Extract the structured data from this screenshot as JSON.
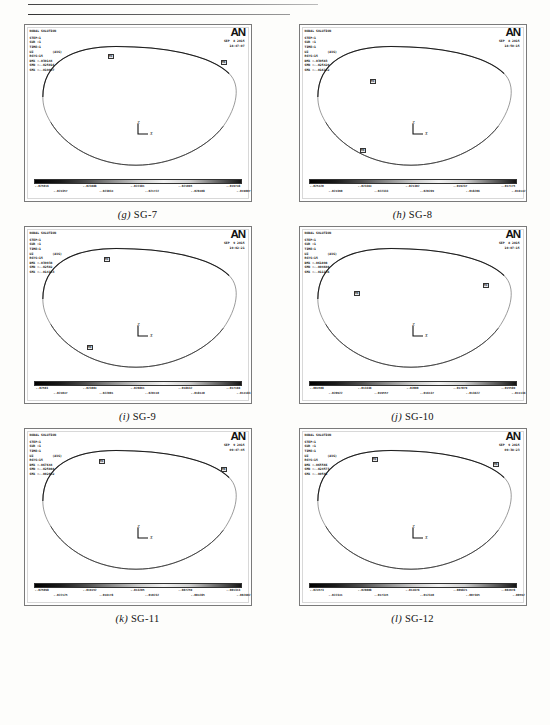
{
  "page": {
    "figure_count": 6,
    "software": "ANSYS",
    "logo_text": "AN"
  },
  "colorbar": {
    "stops": [
      "#000000",
      "#1a1a1a",
      "#4d4d4d",
      "#8c8c8c",
      "#c9c9c9",
      "#f2f2f2",
      "#d0d0d0",
      "#6e6e6e",
      "#141414"
    ],
    "direction": "left-to-right"
  },
  "triad": {
    "z_label": "Z",
    "x_label": "X"
  },
  "panels": [
    {
      "id": "sg-7",
      "caption_letter": "(g)",
      "caption_label": "SG-7",
      "title": "NODAL SOLUTION",
      "date": "SEP  8 2015",
      "time": "18:47:07",
      "lines": [
        "STEP=1",
        "SUB =1",
        "TIME=1",
        "UZ          (AVG)",
        "RSYS=15",
        "DMX =.030144",
        "SMN =-.025016",
        "SMX =-.019007"
      ],
      "dmx": ".030144",
      "smn": "-.025016",
      "smx": "-.019007",
      "cbar_top": [
        "-.025016",
        "-.024088",
        "-.023161",
        "-.022233",
        "-.021306"
      ],
      "cbar_bot": [
        "-.024552",
        "-.023625",
        "-.022697",
        "-.021769",
        "-.019007"
      ],
      "cbar_labels_row_a": [
        "-.025016",
        "-.023688",
        "-.022381",
        "-.021065",
        "-.019748"
      ],
      "cbar_labels_row_b": [
        "-.024357",
        "-.023034",
        "-.021722",
        "-.020408",
        "-.019007"
      ],
      "nodes": [
        {
          "label": "MX",
          "x": 83,
          "y": 29
        },
        {
          "label": "MN",
          "x": 196,
          "y": 35
        }
      ]
    },
    {
      "id": "sg-8",
      "caption_letter": "(h)",
      "caption_label": "SG-8",
      "title": "NODAL SOLUTION",
      "date": "SEP  8 2015",
      "time": "18:50:15",
      "lines": [
        "STEP=1",
        "SUB =1",
        "TIME=1",
        "UZ          (AVG)",
        "RSYS=15",
        "DMX =.039583",
        "SMN =-.025420",
        "SMX =-.016142"
      ],
      "dmx": ".039583",
      "smn": "-.025420",
      "smx": "-.016142",
      "cbar_labels_row_a": [
        "-.025420",
        "-.023364",
        "-.021302",
        "-.019237",
        "-.017175"
      ],
      "cbar_labels_row_b": [
        "-.024390",
        "-.022333",
        "-.020269",
        "-.018206",
        "-.016142"
      ],
      "nodes": [
        {
          "label": "MX",
          "x": 70,
          "y": 54
        },
        {
          "label": "MN",
          "x": 60,
          "y": 123
        }
      ]
    },
    {
      "id": "sg-9",
      "caption_letter": "(i)",
      "caption_label": "SG-9",
      "title": "NODAL SOLUTION",
      "date": "SEP  9 2015",
      "time": "19:02:21",
      "lines": [
        "STEP=1",
        "SUB =1",
        "TIME=1",
        "UZ          (AVG)",
        "RSYS=15",
        "DMX =.039938",
        "SMN =-.02502",
        "SMX =-.014183"
      ],
      "dmx": ".039938",
      "smn": "-.02502",
      "smx": "-.014183",
      "cbar_labels_row_a": [
        "-.02503",
        "-.023004",
        "-.020861",
        "-.018632",
        "-.017166"
      ],
      "cbar_labels_row_b": [
        "-.024047",
        "-.022001",
        "-.020110",
        "-.018140",
        "-.014183"
      ],
      "nodes": [
        {
          "label": "MX",
          "x": 79,
          "y": 30
        },
        {
          "label": "MN",
          "x": 62,
          "y": 118
        }
      ]
    },
    {
      "id": "sg-10",
      "caption_letter": "(j)",
      "caption_label": "SG-10",
      "title": "NODAL SOLUTION",
      "date": "SEP  8 2015",
      "time": "19:07:15",
      "lines": [
        "STEP=1",
        "SUB =1",
        "TIME=1",
        "UZ          (AVG)",
        "RSYS=15",
        "DMX =.061898",
        "SMN =-.004608",
        "SMX =-.011136"
      ],
      "dmx": ".061898",
      "smn": "-.004608",
      "smx": "-.011136",
      "cbar_labels_row_a": [
        "-.004508",
        "-.013336",
        "-.02000",
        "-.017079",
        "-.015589"
      ],
      "cbar_labels_row_b": [
        "-.020922",
        "-.019557",
        "-.016137",
        "-.013622",
        "-.011136"
      ],
      "nodes": [
        {
          "label": "MN",
          "x": 54,
          "y": 64
        },
        {
          "label": "MX",
          "x": 183,
          "y": 56
        }
      ]
    },
    {
      "id": "sg-11",
      "caption_letter": "(k)",
      "caption_label": "SG-11",
      "title": "NODAL SOLUTION",
      "date": "SEP  9 2015",
      "time": "09:47:45",
      "lines": [
        "STEP=1",
        "SUB =1",
        "TIME=1",
        "UZ          (AVG)",
        "RSYS=15",
        "DMX =.067644",
        "SMN =-.025088",
        "SMX =-.002602"
      ],
      "dmx": ".067644",
      "smn": "-.025088",
      "smx": "-.002602",
      "cbar_labels_row_a": [
        "-.025098",
        "-.019152",
        "-.013205",
        "-.007259",
        "-.001313"
      ],
      "cbar_labels_row_b": [
        "-.022125",
        "-.016178",
        "-.010232",
        "-.004285",
        "-.002602"
      ],
      "nodes": [
        {
          "label": "MX",
          "x": 74,
          "y": 30
        },
        {
          "label": "MN",
          "x": 196,
          "y": 38
        }
      ]
    },
    {
      "id": "sg-12",
      "caption_letter": "(l)",
      "caption_label": "SG-12",
      "title": "NODAL SOLUTION",
      "date": "SEP  9 2015",
      "time": "09:38:23",
      "lines": [
        "STEP=1",
        "SUB =1",
        "TIME=1",
        "UZ          (AVG)",
        "RSYS=15",
        "DMX =.065566",
        "SMN =-.024573",
        "SMX =-.00592"
      ],
      "dmx": ".065566",
      "smn": "-.024573",
      "smx": "-.00592",
      "cbar_labels_row_a": [
        "-.024573",
        "-.020008",
        "-.014676",
        "-.009821",
        "-.004978"
      ],
      "cbar_labels_row_b": [
        "-.022341",
        "-.017345",
        "-.012340",
        "-.007365",
        "-.00592"
      ],
      "nodes": [
        {
          "label": "MX",
          "x": 72,
          "y": 28
        },
        {
          "label": "MN",
          "x": 193,
          "y": 33
        }
      ]
    }
  ]
}
